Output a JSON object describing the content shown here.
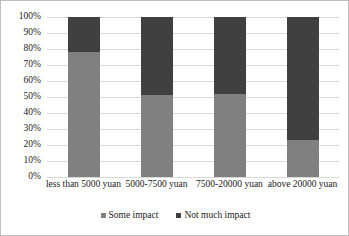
{
  "chart_data": {
    "type": "bar",
    "stacked": true,
    "normalized_percent": true,
    "title": "",
    "subtitle": "",
    "xlabel": "",
    "ylabel": "",
    "ylim": [
      0,
      100
    ],
    "ytick_labels": [
      "100%",
      "90%",
      "80%",
      "70%",
      "60%",
      "50%",
      "40%",
      "30%",
      "20%",
      "10%",
      "0%"
    ],
    "ytick_values": [
      100,
      90,
      80,
      70,
      60,
      50,
      40,
      30,
      20,
      10,
      0
    ],
    "grid": true,
    "grid_axis": "y",
    "legend_position": "bottom",
    "categories": [
      "less than 5000 yuan",
      "5000-7500 yuan",
      "7500-20000 yuan",
      "above 20000 yuan"
    ],
    "series": [
      {
        "name": "Some impact",
        "color": "#808080",
        "values": [
          78,
          51,
          52,
          23
        ]
      },
      {
        "name": "Not much impact",
        "color": "#404040",
        "values": [
          22,
          49,
          48,
          77
        ]
      }
    ]
  },
  "legend": {
    "items": [
      {
        "label": "Some impact",
        "marker": "square-marker"
      },
      {
        "label": "Not much impact",
        "marker": "square-marker"
      }
    ]
  }
}
